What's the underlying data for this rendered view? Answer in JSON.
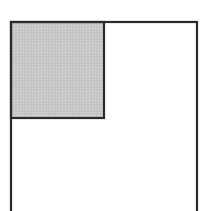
{
  "diagram": {
    "outer_rect": {
      "x": 11,
      "y": 22,
      "width": 186,
      "height": 200,
      "stroke": "#2a2a2a",
      "stroke_width": 2.2,
      "fill": "none"
    },
    "inner_square": {
      "x": 11,
      "y": 22,
      "width": 93,
      "height": 96,
      "stroke": "#2a2a2a",
      "stroke_width": 2.2,
      "fill": "#c9c9c9"
    },
    "colors": {
      "background": "#ffffff",
      "line": "#2a2a2a",
      "shade": "#c9c9c9"
    }
  }
}
